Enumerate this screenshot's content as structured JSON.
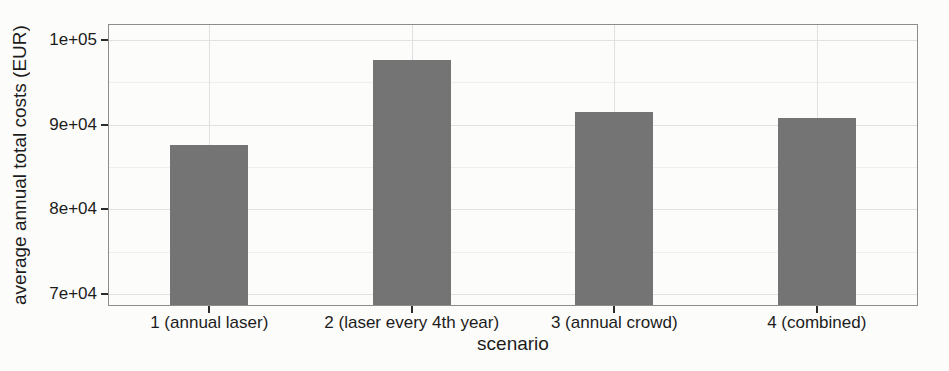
{
  "chart_data": {
    "type": "bar",
    "title": "",
    "xlabel": "scenario",
    "ylabel": "average annual total costs (EUR)",
    "categories": [
      "1 (annual laser)",
      "2 (laser every 4th year)",
      "3 (annual crowd)",
      "4 (combined)"
    ],
    "values": [
      87600,
      97700,
      91500,
      90800
    ],
    "ylim": [
      68600,
      101900
    ],
    "yticks": [
      {
        "value": 70000,
        "label": "7e+04"
      },
      {
        "value": 80000,
        "label": "8e+04"
      },
      {
        "value": 90000,
        "label": "9e+04"
      },
      {
        "value": 100000,
        "label": "1e+05"
      }
    ],
    "yminor": [
      75000,
      85000,
      95000
    ],
    "grid": true,
    "legend_position": "none"
  },
  "style": {
    "bar_color": "#747474",
    "panel_border": "#8c8c8c",
    "grid_major": "#e1e1e1",
    "grid_minor": "#efefef",
    "tick_color": "#2b2b2b",
    "text_color": "#1c1c1c",
    "paper": "#fcfcfb"
  }
}
